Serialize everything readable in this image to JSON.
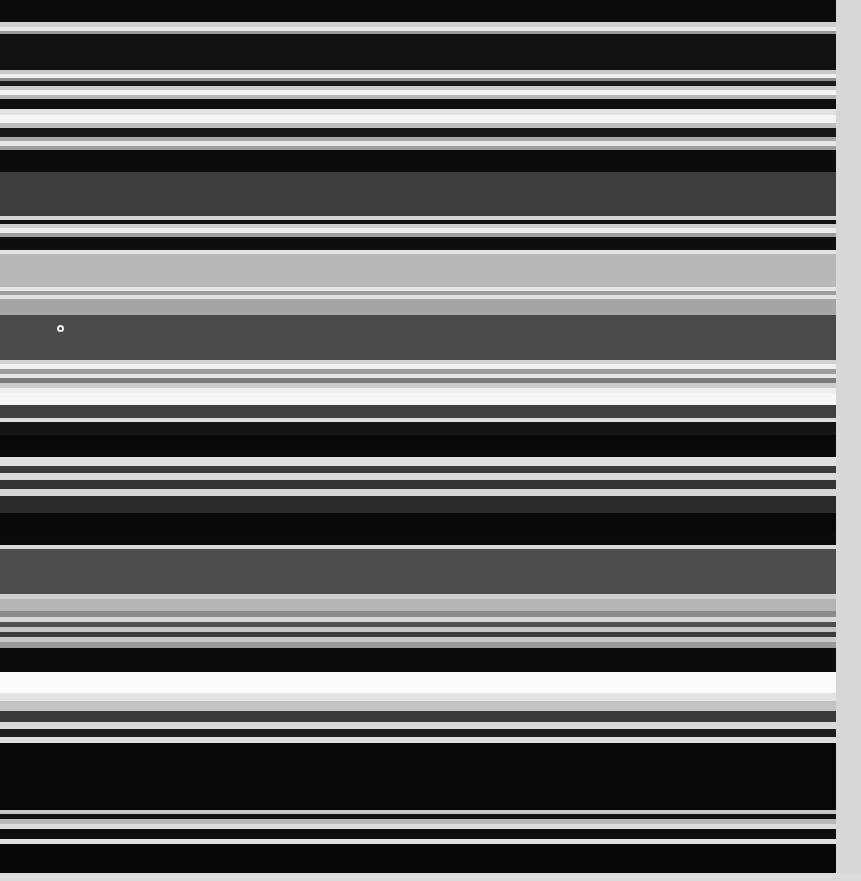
{
  "capture": {
    "width": 861,
    "height": 881,
    "description": "Severely vertically motion-blurred screenshot of a dark-theme user interface. All glyphs have smeared into horizontal luminance bands; no text is legible.",
    "background_color": "#0b0b0b",
    "content_column_width": 836,
    "legible_text": "none"
  },
  "right_margin": {
    "name": "page-gutter",
    "x": 836,
    "width": 25,
    "color": "#d8d8d8"
  },
  "bullet_marker": {
    "name": "bullet-dot",
    "x": 57,
    "y": 325,
    "diameter": 7,
    "ring_color": "#f2f2f2",
    "fill_color": "#3a3a3a"
  },
  "bottom_strip": {
    "y": 873,
    "height": 8,
    "color": "#dcdcdc"
  },
  "bands": [
    {
      "y": 0,
      "h": 22,
      "color": "#0a0a0a"
    },
    {
      "y": 22,
      "h": 5,
      "color": "#cfcfcf"
    },
    {
      "y": 27,
      "h": 4,
      "color": "#e9e9e9"
    },
    {
      "y": 31,
      "h": 3,
      "color": "#9a9a9a"
    },
    {
      "y": 34,
      "h": 36,
      "color": "#101010"
    },
    {
      "y": 70,
      "h": 4,
      "color": "#c9c9c9"
    },
    {
      "y": 74,
      "h": 4,
      "color": "#efefef"
    },
    {
      "y": 78,
      "h": 3,
      "color": "#8e8e8e"
    },
    {
      "y": 81,
      "h": 5,
      "color": "#1a1a1a"
    },
    {
      "y": 86,
      "h": 4,
      "color": "#cdcdcd"
    },
    {
      "y": 90,
      "h": 5,
      "color": "#f3f3f3"
    },
    {
      "y": 95,
      "h": 4,
      "color": "#b4b4b4"
    },
    {
      "y": 99,
      "h": 10,
      "color": "#0d0d0d"
    },
    {
      "y": 109,
      "h": 6,
      "color": "#e2e2e2"
    },
    {
      "y": 115,
      "h": 8,
      "color": "#f6f6f6"
    },
    {
      "y": 123,
      "h": 5,
      "color": "#c0c0c0"
    },
    {
      "y": 128,
      "h": 9,
      "color": "#161616"
    },
    {
      "y": 137,
      "h": 4,
      "color": "#a8a8a8"
    },
    {
      "y": 141,
      "h": 5,
      "color": "#e7e7e7"
    },
    {
      "y": 146,
      "h": 4,
      "color": "#9c9c9c"
    },
    {
      "y": 150,
      "h": 22,
      "color": "#0c0c0c"
    },
    {
      "y": 172,
      "h": 44,
      "color": "#3d3d3d"
    },
    {
      "y": 216,
      "h": 4,
      "color": "#d5d5d5"
    },
    {
      "y": 220,
      "h": 4,
      "color": "#101010"
    },
    {
      "y": 224,
      "h": 4,
      "color": "#cfcfcf"
    },
    {
      "y": 228,
      "h": 5,
      "color": "#ededed"
    },
    {
      "y": 233,
      "h": 4,
      "color": "#9f9f9f"
    },
    {
      "y": 237,
      "h": 13,
      "color": "#0e0e0e"
    },
    {
      "y": 250,
      "h": 4,
      "color": "#e4e4e4"
    },
    {
      "y": 254,
      "h": 33,
      "color": "#b9b9b9"
    },
    {
      "y": 287,
      "h": 4,
      "color": "#e8e8e8"
    },
    {
      "y": 291,
      "h": 4,
      "color": "#a0a0a0"
    },
    {
      "y": 295,
      "h": 4,
      "color": "#e2e2e2"
    },
    {
      "y": 299,
      "h": 16,
      "color": "#a6a6a6"
    },
    {
      "y": 315,
      "h": 45,
      "color": "#4a4a4a"
    },
    {
      "y": 360,
      "h": 4,
      "color": "#d2d2d2"
    },
    {
      "y": 364,
      "h": 5,
      "color": "#f0f0f0"
    },
    {
      "y": 369,
      "h": 5,
      "color": "#9d9d9d"
    },
    {
      "y": 374,
      "h": 4,
      "color": "#e6e6e6"
    },
    {
      "y": 378,
      "h": 5,
      "color": "#7c7c7c"
    },
    {
      "y": 383,
      "h": 5,
      "color": "#cccccc"
    },
    {
      "y": 388,
      "h": 5,
      "color": "#efefef"
    },
    {
      "y": 393,
      "h": 12,
      "color": "#f7f7f7"
    },
    {
      "y": 405,
      "h": 13,
      "color": "#3f3f3f"
    },
    {
      "y": 418,
      "h": 4,
      "color": "#dedede"
    },
    {
      "y": 422,
      "h": 13,
      "color": "#141414"
    },
    {
      "y": 435,
      "h": 22,
      "color": "#080808"
    },
    {
      "y": 457,
      "h": 9,
      "color": "#e0e0e0"
    },
    {
      "y": 466,
      "h": 7,
      "color": "#3a3a3a"
    },
    {
      "y": 473,
      "h": 7,
      "color": "#dadada"
    },
    {
      "y": 480,
      "h": 9,
      "color": "#333333"
    },
    {
      "y": 489,
      "h": 7,
      "color": "#d6d6d6"
    },
    {
      "y": 496,
      "h": 17,
      "color": "#2b2b2b"
    },
    {
      "y": 513,
      "h": 20,
      "color": "#070707"
    },
    {
      "y": 533,
      "h": 12,
      "color": "#0a0a0a"
    },
    {
      "y": 545,
      "h": 4,
      "color": "#d9d9d9"
    },
    {
      "y": 549,
      "h": 45,
      "color": "#4c4c4c"
    },
    {
      "y": 594,
      "h": 5,
      "color": "#cfcfcf"
    },
    {
      "y": 599,
      "h": 12,
      "color": "#b5b5b5"
    },
    {
      "y": 611,
      "h": 6,
      "color": "#8c8c8c"
    },
    {
      "y": 617,
      "h": 5,
      "color": "#d8d8d8"
    },
    {
      "y": 622,
      "h": 5,
      "color": "#4f4f4f"
    },
    {
      "y": 627,
      "h": 5,
      "color": "#c6c6c6"
    },
    {
      "y": 632,
      "h": 5,
      "color": "#3c3c3c"
    },
    {
      "y": 637,
      "h": 5,
      "color": "#cacaca"
    },
    {
      "y": 642,
      "h": 6,
      "color": "#9b9b9b"
    },
    {
      "y": 648,
      "h": 24,
      "color": "#0c0c0c"
    },
    {
      "y": 672,
      "h": 21,
      "color": "#fbfbfb"
    },
    {
      "y": 693,
      "h": 8,
      "color": "#e3e3e3"
    },
    {
      "y": 701,
      "h": 10,
      "color": "#c4c4c4"
    },
    {
      "y": 711,
      "h": 11,
      "color": "#3a3a3a"
    },
    {
      "y": 722,
      "h": 7,
      "color": "#d9d9d9"
    },
    {
      "y": 729,
      "h": 8,
      "color": "#1b1b1b"
    },
    {
      "y": 737,
      "h": 6,
      "color": "#dddddd"
    },
    {
      "y": 743,
      "h": 67,
      "color": "#070707"
    },
    {
      "y": 810,
      "h": 4,
      "color": "#c8c8c8"
    },
    {
      "y": 814,
      "h": 5,
      "color": "#111111"
    },
    {
      "y": 819,
      "h": 5,
      "color": "#b9b9b9"
    },
    {
      "y": 824,
      "h": 5,
      "color": "#dddddd"
    },
    {
      "y": 829,
      "h": 10,
      "color": "#0d0d0d"
    },
    {
      "y": 839,
      "h": 5,
      "color": "#e0e0e0"
    },
    {
      "y": 844,
      "h": 29,
      "color": "#060606"
    }
  ]
}
